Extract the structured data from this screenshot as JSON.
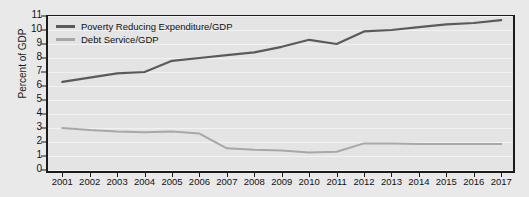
{
  "chart_data": {
    "type": "line",
    "title": "",
    "xlabel": "",
    "ylabel": "Percent of GDP",
    "ylim": [
      0,
      11
    ],
    "ytick_values": [
      0,
      1,
      2,
      3,
      4,
      5,
      6,
      7,
      8,
      9,
      10,
      11
    ],
    "ytick_labels": [
      "0",
      "1",
      "2",
      "3",
      "4",
      "5",
      "6",
      "7",
      "8",
      "9",
      "10",
      "11"
    ],
    "grid": true,
    "legend_position": "top-left",
    "categories": [
      "2001",
      "2002",
      "2003",
      "2004",
      "2005",
      "2006",
      "2007",
      "2008",
      "2009",
      "2010",
      "2011",
      "2012",
      "2013",
      "2014",
      "2015",
      "2016",
      "2017"
    ],
    "x": [
      2001,
      2002,
      2003,
      2004,
      2005,
      2006,
      2007,
      2008,
      2009,
      2010,
      2011,
      2012,
      2013,
      2014,
      2015,
      2016,
      2017
    ],
    "series": [
      {
        "name": "Poverty Reducing Expenditure/GDP",
        "color": "#5a5a5a",
        "values": [
          6.3,
          6.6,
          6.9,
          7.0,
          7.8,
          8.0,
          8.2,
          8.4,
          8.8,
          9.3,
          9.0,
          9.9,
          10.0,
          10.2,
          10.4,
          10.5,
          10.7
        ]
      },
      {
        "name": "Debt Service/GDP",
        "color": "#a8a8a8",
        "values": [
          3.0,
          2.85,
          2.75,
          2.7,
          2.75,
          2.6,
          1.55,
          1.45,
          1.4,
          1.25,
          1.3,
          1.9,
          1.9,
          1.85,
          1.85,
          1.85,
          1.85
        ]
      }
    ]
  },
  "colors": {
    "page_background": "#e9e9e9",
    "plot_background": "#e4e4e4",
    "axis": "#1b1b1b",
    "gridline": "#f2f2f2",
    "series_dark": "#5a5a5a",
    "series_light": "#a8a8a8"
  }
}
